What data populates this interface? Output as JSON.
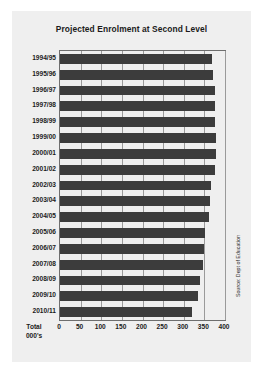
{
  "chart_data": {
    "type": "bar",
    "orientation": "horizontal",
    "title": "Projected Enrolment at Second Level",
    "xlabel": "Total 000's",
    "ylabel": "",
    "xlim": [
      0,
      400
    ],
    "xticks": [
      0,
      50,
      100,
      150,
      200,
      250,
      300,
      350,
      400
    ],
    "grid": true,
    "legend": false,
    "bar_color": "#3c3c3c",
    "categories": [
      "1994/95",
      "1995/96",
      "1996/97",
      "1997/98",
      "1998/99",
      "1999/00",
      "2000/01",
      "2001/02",
      "2002/03",
      "2003/04",
      "2004/05",
      "2005/06",
      "2006/07",
      "2007/08",
      "2008/09",
      "2009/10",
      "2010/11"
    ],
    "values": [
      368,
      372,
      375,
      375,
      375,
      377,
      378,
      375,
      366,
      364,
      361,
      352,
      348,
      346,
      340,
      334,
      321
    ],
    "annotations": [
      "Source: Dept of Education"
    ]
  },
  "figure": {
    "title": "Projected Enrolment at Second Level",
    "axis_caption_line1": "Total",
    "axis_caption_line2": "000's",
    "source_note": "Source: Dept of Education"
  }
}
